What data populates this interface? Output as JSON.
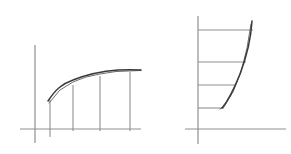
{
  "figure": {
    "width": 291,
    "height": 154,
    "background_color": "#ffffff",
    "style": "hand-drawn pencil sketch, no text labels",
    "colors": {
      "axis": "#8f8f8f",
      "bar": "#909090",
      "curve_primary": "#3a3a3a",
      "curve_secondary": "#5c5c5c",
      "background": "#ffffff"
    },
    "stroke_widths": {
      "axis": 1.2,
      "bar": 1.1,
      "curve_primary": 1.5,
      "curve_secondary": 0.9
    }
  },
  "chart_data": [
    {
      "id": "left-panel",
      "type": "bar",
      "title": "",
      "subtitle": "",
      "xlabel": "",
      "ylabel": "",
      "grid": false,
      "legend": null,
      "annotations": [],
      "description": "Concave increasing curve rising from left, approximated below by four vertical ordinate bars standing on the horizontal axis.",
      "axes": {
        "x_axis": {
          "x1": 20,
          "y1": 129,
          "x2": 141,
          "y2": 129
        },
        "y_axis": {
          "x1": 35,
          "y1": 45,
          "x2": 35,
          "y2": 143
        },
        "xlim": [
          20,
          141
        ],
        "ylim": [
          129,
          45
        ]
      },
      "categories": [
        "1",
        "2",
        "3",
        "4"
      ],
      "x": [
        50,
        73,
        100,
        130
      ],
      "values": [
        29,
        44,
        53,
        57
      ],
      "bars": [
        {
          "x": 50,
          "y_top": 100,
          "y_bottom": 137,
          "height": 29
        },
        {
          "x": 73,
          "y_top": 85,
          "y_bottom": 131,
          "height": 44
        },
        {
          "x": 100,
          "y_top": 76,
          "y_bottom": 131,
          "height": 53
        },
        {
          "x": 130,
          "y_top": 72,
          "y_bottom": 131,
          "height": 57
        }
      ],
      "curve": {
        "name": "primary-curve",
        "path": "M 48 101 C 56 89, 62 84, 73 80 C 88 74, 104 71, 118 70 C 127 69.5, 134 69.5, 141 70",
        "shape": "concave-down increasing"
      },
      "curve_secondary": {
        "name": "chord-polyline",
        "path": "M 49 103 L 60 90 L 73 82 L 86 77 L 100 74 L 116 71.5 L 141 70.5",
        "shape": "piecewise linear chords under curve"
      }
    },
    {
      "id": "right-panel",
      "type": "bar",
      "title": "",
      "subtitle": "",
      "xlabel": "",
      "ylabel": "",
      "grid": false,
      "legend": null,
      "annotations": [],
      "description": "Convex curve descending from upper right to a bottom vertex, approximated by four horizontal bars extending right from the vertical axis.",
      "axes": {
        "x_axis": {
          "x1": 185,
          "y1": 129,
          "x2": 286,
          "y2": 129
        },
        "y_axis": {
          "x1": 198,
          "y1": 16,
          "x2": 198,
          "y2": 144
        },
        "xlim": [
          185,
          286
        ],
        "ylim": [
          129,
          16
        ]
      },
      "categories": [
        "1",
        "2",
        "3",
        "4"
      ],
      "y": [
        30,
        62,
        85,
        108
      ],
      "values": [
        55,
        48,
        38,
        26
      ],
      "bars": [
        {
          "y": 30,
          "x_left": 198,
          "x_right": 253,
          "length": 55
        },
        {
          "y": 62,
          "x_left": 198,
          "x_right": 246,
          "length": 48
        },
        {
          "y": 85,
          "x_left": 198,
          "x_right": 236,
          "length": 38
        },
        {
          "y": 108,
          "x_left": 198,
          "x_right": 224,
          "length": 26
        }
      ],
      "curve": {
        "name": "primary-curve",
        "path": "M 252 21 C 251 38, 247 56, 240 74 C 234 89, 228 101, 222 108",
        "shape": "convex decreasing"
      },
      "curve_secondary": {
        "name": "chord-polyline",
        "path": "M 251 24 L 247 48 L 241 72 L 233 92 L 224 107 L 220 109",
        "shape": "piecewise linear chords inside curve"
      }
    }
  ]
}
